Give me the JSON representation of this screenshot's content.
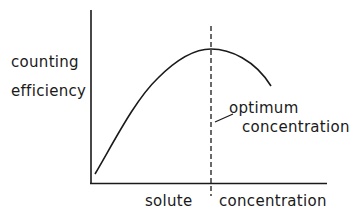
{
  "diagram": {
    "y_axis_label": [
      "counting",
      "efficiency"
    ],
    "x_axis_label": {
      "left": "solute",
      "right": "concentration"
    },
    "annotation": {
      "line1": "optimum",
      "line2": "concentration"
    },
    "colors": {
      "ink": "#1a1a1a",
      "background": "#ffffff"
    }
  }
}
